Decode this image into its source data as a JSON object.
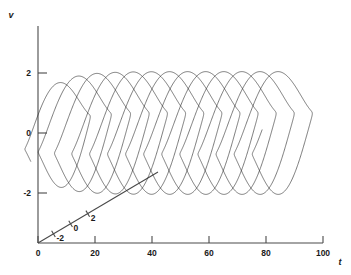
{
  "chart_data": {
    "type": "line",
    "title": "",
    "subtitle": "",
    "projection": "3d-oblique",
    "grid": false,
    "legend": null,
    "axes": {
      "t": {
        "label": "t",
        "ticks": [
          0,
          20,
          40,
          60,
          80,
          100
        ],
        "ticklabels": [
          "0",
          "20",
          "40",
          "60",
          "80",
          "100"
        ],
        "range": [
          0,
          100
        ],
        "orientation": "horizontal"
      },
      "v": {
        "label": "v",
        "ticks": [
          2,
          0,
          -2
        ],
        "ticklabels": [
          "2",
          "0",
          "-2"
        ],
        "range": [
          -3.2,
          2.9
        ],
        "orientation": "vertical"
      },
      "x": {
        "label": "",
        "ticks": [
          -2,
          0,
          2
        ],
        "ticklabels": [
          "-2",
          "0",
          "2"
        ],
        "range": [
          -3.4,
          3.4
        ],
        "orientation": "oblique-depth"
      }
    },
    "series": [
      {
        "name": "limit-cycle trajectory",
        "color": "#2b2b2b",
        "t_start": 4.0,
        "t_end": 88.0,
        "samples": 5400,
        "oscillation_period": 6.35,
        "v_amplitude": 1.78,
        "v_min": -1.92,
        "v_max": 1.78,
        "x_amplitude": 2.05,
        "transient_growth_tau": 7.0,
        "x0": 0.22,
        "v0": 0.05
      }
    ],
    "annotations": []
  },
  "figure": {
    "background": "#ffffff",
    "line_color": "#2b2b2b",
    "axis_color": "#4a4a4a",
    "text_color": "#1a1a1a"
  }
}
